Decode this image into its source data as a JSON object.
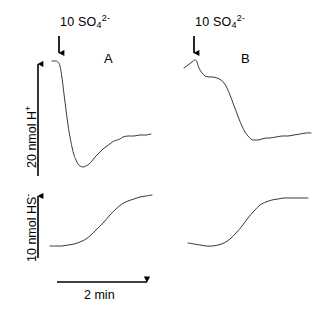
{
  "figure": {
    "background": "#ffffff",
    "trace_color": "#3a3a3a",
    "bar_color": "#000000"
  },
  "panels": [
    {
      "id": "A",
      "letter": "A",
      "injection": {
        "amount": "10",
        "species_main": "SO",
        "species_sub": "4",
        "species_sup": "2-",
        "full_text": "10 SO4 2-",
        "arrow_icon": "down-arrow-icon"
      }
    },
    {
      "id": "B",
      "letter": "B",
      "injection": {
        "amount": "10",
        "species_main": "SO",
        "species_sub": "4",
        "species_sup": "2-",
        "full_text": "10 SO4 2-",
        "arrow_icon": "down-arrow-icon"
      }
    }
  ],
  "scale_bars": {
    "proton": {
      "value": "20",
      "unit": "nmol",
      "species_main": "H",
      "species_sup": "+",
      "full_text": "20 nmol H+",
      "orientation": "vertical",
      "icon": "double-headed-vertical-arrow-icon"
    },
    "sulfide": {
      "value": "10",
      "unit": "nmol",
      "species_main": "HS",
      "species_sup": "-",
      "full_text": "10 nmol HS-",
      "orientation": "vertical",
      "icon": "up-arrow-icon"
    },
    "time": {
      "value": "2",
      "unit": "min",
      "full_text": "2 min",
      "orientation": "horizontal",
      "icon": "horizontal-scale-bar-icon"
    }
  },
  "chart_data": {
    "type": "line",
    "title": "",
    "xlabel": "2 min",
    "ylabel": "20 nmol H+ / 10 nmol HS-",
    "grid": false,
    "legend": "none",
    "axes_style": "scale-bars-only",
    "note": "Two recordings (A and B) of medium H+ and HS- after addition of 10 nmol sulfate (arrow). Values below are pixel-space polyline vertices; y increases downward, so a falling trace = H+ consumption.",
    "series": [
      {
        "name": "A-proton",
        "panel": "A",
        "measurement": "H+",
        "points": [
          [
            52,
            61
          ],
          [
            56,
            61
          ],
          [
            58,
            62
          ],
          [
            60,
            66
          ],
          [
            62,
            78
          ],
          [
            64,
            94
          ],
          [
            66,
            110
          ],
          [
            68,
            125
          ],
          [
            70,
            137
          ],
          [
            72,
            147
          ],
          [
            74,
            155
          ],
          [
            76,
            160
          ],
          [
            78,
            164
          ],
          [
            80,
            166
          ],
          [
            83,
            167
          ],
          [
            86,
            166
          ],
          [
            89,
            164
          ],
          [
            92,
            161
          ],
          [
            95,
            157
          ],
          [
            99,
            153
          ],
          [
            103,
            149
          ],
          [
            107,
            146
          ],
          [
            111,
            143
          ],
          [
            114,
            141
          ],
          [
            117,
            140
          ],
          [
            120,
            139
          ],
          [
            123,
            137
          ],
          [
            128,
            136
          ],
          [
            134,
            136
          ],
          [
            140,
            135
          ],
          [
            146,
            135
          ],
          [
            151,
            134
          ]
        ]
      },
      {
        "name": "A-sulfide",
        "panel": "A",
        "measurement": "HS-",
        "points": [
          [
            50,
            246
          ],
          [
            56,
            246
          ],
          [
            62,
            246
          ],
          [
            68,
            245
          ],
          [
            74,
            244
          ],
          [
            80,
            242
          ],
          [
            86,
            239
          ],
          [
            92,
            234
          ],
          [
            98,
            228
          ],
          [
            104,
            222
          ],
          [
            110,
            215
          ],
          [
            116,
            209
          ],
          [
            122,
            204
          ],
          [
            128,
            201
          ],
          [
            134,
            199
          ],
          [
            140,
            197
          ],
          [
            146,
            196
          ],
          [
            152,
            195
          ]
        ]
      },
      {
        "name": "B-proton",
        "panel": "B",
        "measurement": "H+",
        "points": [
          [
            184,
            68
          ],
          [
            188,
            65
          ],
          [
            192,
            62
          ],
          [
            195,
            60
          ],
          [
            197,
            62
          ],
          [
            199,
            68
          ],
          [
            202,
            73
          ],
          [
            205,
            76
          ],
          [
            209,
            77
          ],
          [
            213,
            77
          ],
          [
            217,
            78
          ],
          [
            221,
            80
          ],
          [
            224,
            83
          ],
          [
            227,
            88
          ],
          [
            230,
            95
          ],
          [
            233,
            103
          ],
          [
            236,
            111
          ],
          [
            239,
            119
          ],
          [
            242,
            126
          ],
          [
            245,
            132
          ],
          [
            248,
            136
          ],
          [
            251,
            139
          ],
          [
            254,
            140
          ],
          [
            258,
            140
          ],
          [
            262,
            139
          ],
          [
            266,
            138
          ],
          [
            270,
            138
          ],
          [
            276,
            137
          ],
          [
            282,
            136
          ],
          [
            288,
            136
          ],
          [
            294,
            135
          ],
          [
            300,
            134
          ],
          [
            306,
            133
          ],
          [
            311,
            133
          ]
        ]
      },
      {
        "name": "B-sulfide",
        "panel": "B",
        "measurement": "HS-",
        "points": [
          [
            188,
            243
          ],
          [
            194,
            244
          ],
          [
            200,
            245
          ],
          [
            206,
            246
          ],
          [
            212,
            246
          ],
          [
            218,
            245
          ],
          [
            224,
            243
          ],
          [
            230,
            239
          ],
          [
            236,
            233
          ],
          [
            242,
            226
          ],
          [
            248,
            218
          ],
          [
            254,
            211
          ],
          [
            260,
            205
          ],
          [
            266,
            202
          ],
          [
            272,
            200
          ],
          [
            278,
            199
          ],
          [
            284,
            198
          ],
          [
            290,
            198
          ],
          [
            296,
            198
          ],
          [
            302,
            198
          ],
          [
            308,
            198
          ]
        ]
      }
    ],
    "annotations": [
      {
        "text": "A",
        "x": 108,
        "y": 60,
        "kind": "panel-letter"
      },
      {
        "text": "B",
        "x": 245,
        "y": 60,
        "kind": "panel-letter"
      },
      {
        "text": "10 SO4 2-",
        "x": 60,
        "y": 22,
        "kind": "injection-label"
      },
      {
        "text": "10 SO4 2-",
        "x": 196,
        "y": 22,
        "kind": "injection-label"
      },
      {
        "kind": "arrow",
        "panel": "A",
        "x": 59,
        "y0": 37,
        "y1": 55
      },
      {
        "kind": "arrow",
        "panel": "B",
        "x": 194,
        "y0": 37,
        "y1": 55
      },
      {
        "kind": "scale-bar",
        "name": "20 nmol H+",
        "x": 38,
        "y0": 60,
        "y1": 176
      },
      {
        "kind": "scale-bar",
        "name": "10 nmol HS-",
        "x": 38,
        "y0": 192,
        "y1": 258
      },
      {
        "kind": "scale-bar",
        "name": "2 min",
        "y": 282,
        "x0": 57,
        "x1": 150
      }
    ]
  }
}
